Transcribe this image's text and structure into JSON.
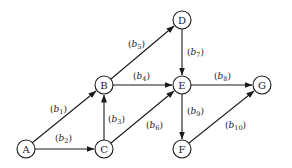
{
  "diagram": {
    "type": "directed-graph",
    "nodes": [
      {
        "id": "A",
        "label": "A",
        "x": 26,
        "y": 149
      },
      {
        "id": "B",
        "label": "B",
        "x": 104,
        "y": 85
      },
      {
        "id": "C",
        "label": "C",
        "x": 104,
        "y": 149
      },
      {
        "id": "D",
        "label": "D",
        "x": 182,
        "y": 20
      },
      {
        "id": "E",
        "label": "E",
        "x": 182,
        "y": 85
      },
      {
        "id": "F",
        "label": "F",
        "x": 182,
        "y": 149
      },
      {
        "id": "G",
        "label": "G",
        "x": 262,
        "y": 85
      }
    ],
    "edges": [
      {
        "id": "b1",
        "from": "A",
        "to": "B",
        "label_var": "b",
        "label_sub": "1"
      },
      {
        "id": "b2",
        "from": "A",
        "to": "C",
        "label_var": "b",
        "label_sub": "2"
      },
      {
        "id": "b3",
        "from": "C",
        "to": "B",
        "label_var": "b",
        "label_sub": "3"
      },
      {
        "id": "b4",
        "from": "B",
        "to": "E",
        "label_var": "b",
        "label_sub": "4"
      },
      {
        "id": "b5",
        "from": "B",
        "to": "D",
        "label_var": "b",
        "label_sub": "5"
      },
      {
        "id": "b6",
        "from": "C",
        "to": "E",
        "label_var": "b",
        "label_sub": "6"
      },
      {
        "id": "b7",
        "from": "D",
        "to": "E",
        "label_var": "b",
        "label_sub": "7"
      },
      {
        "id": "b8",
        "from": "E",
        "to": "G",
        "label_var": "b",
        "label_sub": "8"
      },
      {
        "id": "b9",
        "from": "E",
        "to": "F",
        "label_var": "b",
        "label_sub": "9"
      },
      {
        "id": "b10",
        "from": "F",
        "to": "G",
        "label_var": "b",
        "label_sub": "10"
      }
    ]
  }
}
